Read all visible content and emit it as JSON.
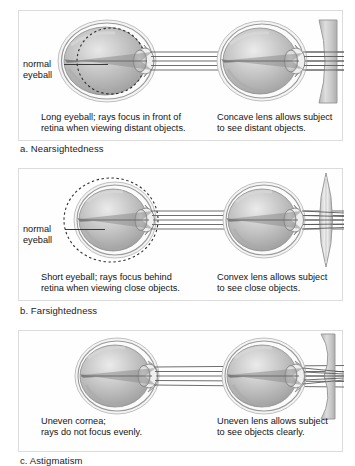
{
  "figure": {
    "title_visible": false,
    "type": "vision-disorders-diagram",
    "panel_count": 3
  },
  "colors": {
    "panel_border": "#dcdcdc",
    "panel_background": "#fefefe",
    "page_background": "#ffffff",
    "text": "#141414",
    "ray_line": "#555555",
    "sclera_outline": "#8a8a8a",
    "vitreous_fill": "#b9b9b9",
    "lens_glass": "#c9c9c9",
    "dashed_outline": "#2e2e2e"
  },
  "panels": [
    {
      "id": "nearsightedness",
      "section_label": "a. Nearsightedness",
      "left": {
        "eye_name": "long-eyeball-uncorrected",
        "caption": "Long eyeball; rays focus in front of\nretina when viewing distant objects.",
        "annotation_label": "normal\neyeball",
        "has_dashed_normal_outline": true,
        "dashed_outline_position": "inside",
        "ray_count": 5,
        "corrective_lens": null
      },
      "right": {
        "eye_name": "long-eyeball-corrected",
        "caption": "Concave lens allows subject\nto see distant objects.",
        "has_dashed_normal_outline": false,
        "ray_count": 5,
        "corrective_lens": "concave"
      }
    },
    {
      "id": "farsightedness",
      "section_label": "b. Farsightedness",
      "left": {
        "eye_name": "short-eyeball-uncorrected",
        "caption": "Short eyeball; rays focus behind\nretina when viewing close objects.",
        "annotation_label": "normal\neyeball",
        "has_dashed_normal_outline": true,
        "dashed_outline_position": "outside",
        "ray_count": 5,
        "corrective_lens": null
      },
      "right": {
        "eye_name": "short-eyeball-corrected",
        "caption": "Convex lens allows subject\nto see close objects.",
        "has_dashed_normal_outline": false,
        "ray_count": 5,
        "corrective_lens": "convex"
      }
    },
    {
      "id": "astigmatism",
      "section_label": "c. Astigmatism",
      "section_label_clipped": true,
      "left": {
        "eye_name": "uneven-cornea-uncorrected",
        "caption": "Uneven cornea;\nrays do not focus evenly.",
        "annotation_label": null,
        "has_dashed_normal_outline": false,
        "ray_count": 5,
        "corrective_lens": null
      },
      "right": {
        "eye_name": "uneven-cornea-corrected",
        "caption": "Uneven lens allows subject\nto see objects clearly.",
        "has_dashed_normal_outline": false,
        "ray_count": 5,
        "corrective_lens": "uneven"
      }
    }
  ]
}
